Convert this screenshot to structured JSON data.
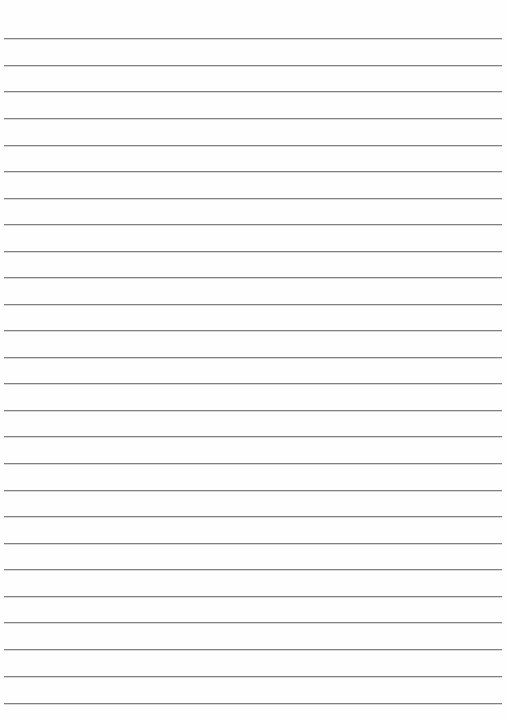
{
  "page": {
    "width_px": 506,
    "height_px": 721,
    "background_color": "#fefefe",
    "orientation": "portrait"
  },
  "ruling": {
    "line_color": "#777777",
    "line_count": 26,
    "line_spacing_px": 26.6,
    "first_line_y_px": 38,
    "last_line_y_px": 703,
    "line_left_x_px": 4,
    "line_right_x_px": 502,
    "line_thickness_px": 1,
    "margin_line": "none",
    "style": "wide-ruled"
  },
  "content": {
    "written_text": "",
    "note": ""
  },
  "lines": [
    {
      "index": 1,
      "y": 38,
      "left": 4,
      "right": 502
    },
    {
      "index": 2,
      "y": 65,
      "left": 4,
      "right": 502
    },
    {
      "index": 3,
      "y": 91,
      "left": 4,
      "right": 502
    },
    {
      "index": 4,
      "y": 118,
      "left": 4,
      "right": 502
    },
    {
      "index": 5,
      "y": 145,
      "left": 4,
      "right": 502
    },
    {
      "index": 6,
      "y": 171,
      "left": 4,
      "right": 502
    },
    {
      "index": 7,
      "y": 198,
      "left": 4,
      "right": 502
    },
    {
      "index": 8,
      "y": 224,
      "left": 4,
      "right": 502
    },
    {
      "index": 9,
      "y": 251,
      "left": 4,
      "right": 502
    },
    {
      "index": 10,
      "y": 277,
      "left": 4,
      "right": 502
    },
    {
      "index": 11,
      "y": 304,
      "left": 4,
      "right": 502
    },
    {
      "index": 12,
      "y": 330,
      "left": 4,
      "right": 502
    },
    {
      "index": 13,
      "y": 357,
      "left": 4,
      "right": 502
    },
    {
      "index": 14,
      "y": 383,
      "left": 4,
      "right": 502
    },
    {
      "index": 15,
      "y": 410,
      "left": 4,
      "right": 502
    },
    {
      "index": 16,
      "y": 436,
      "left": 4,
      "right": 502
    },
    {
      "index": 17,
      "y": 463,
      "left": 4,
      "right": 502
    },
    {
      "index": 18,
      "y": 490,
      "left": 4,
      "right": 502
    },
    {
      "index": 19,
      "y": 516,
      "left": 4,
      "right": 502
    },
    {
      "index": 20,
      "y": 543,
      "left": 4,
      "right": 502
    },
    {
      "index": 21,
      "y": 569,
      "left": 4,
      "right": 502
    },
    {
      "index": 22,
      "y": 596,
      "left": 4,
      "right": 502
    },
    {
      "index": 23,
      "y": 622,
      "left": 4,
      "right": 502
    },
    {
      "index": 24,
      "y": 649,
      "left": 4,
      "right": 502
    },
    {
      "index": 25,
      "y": 676,
      "left": 4,
      "right": 502
    },
    {
      "index": 26,
      "y": 703,
      "left": 4,
      "right": 502
    }
  ]
}
